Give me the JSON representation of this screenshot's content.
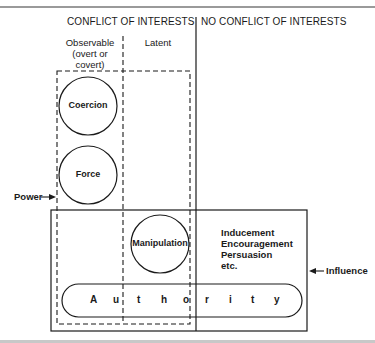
{
  "header": {
    "conflict": "CONFLICT OF INTERESTS",
    "no_conflict": "NO CONFLICT OF INTERESTS"
  },
  "subheaders": {
    "observable_line1": "Observable",
    "observable_line2": "(overt or",
    "observable_line3": "covert)",
    "latent": "Latent"
  },
  "circles": {
    "coercion": "Coercion",
    "force": "Force",
    "manipulation": "Manipulation"
  },
  "influence_list": {
    "item1": "Inducement",
    "item2": "Encouragement",
    "item3": "Persuasion",
    "item4": "etc."
  },
  "authority": {
    "letters": [
      "A",
      "u",
      "t",
      "h",
      "o",
      "r",
      "i",
      "t",
      "y"
    ]
  },
  "arrows": {
    "power": "Power",
    "influence": "Influence"
  },
  "colors": {
    "ink": "#1a1a1a",
    "background": "#ffffff"
  }
}
